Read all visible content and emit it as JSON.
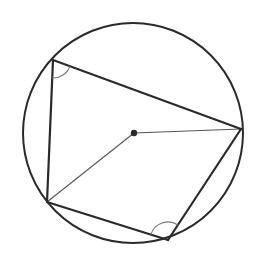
{
  "diagram": {
    "type": "cyclic-quadrilateral",
    "width": 266,
    "height": 258,
    "colors": {
      "background": "#ffffff",
      "stroke": "#2a2a2a",
      "thin_stroke": "#555555",
      "arc_stroke": "#777777"
    },
    "circle": {
      "cx": 133,
      "cy": 133,
      "r": 110
    },
    "center_point": {
      "x": 134,
      "y": 133,
      "r": 3.2
    },
    "vertices": [
      {
        "id": "A",
        "x": 53,
        "y": 60
      },
      {
        "id": "B",
        "x": 241,
        "y": 129
      },
      {
        "id": "C",
        "x": 168,
        "y": 240
      },
      {
        "id": "D",
        "x": 47,
        "y": 202
      }
    ],
    "quadrilateral_edges": [
      [
        "A",
        "B"
      ],
      [
        "B",
        "C"
      ],
      [
        "C",
        "D"
      ],
      [
        "D",
        "A"
      ]
    ],
    "radii": [
      {
        "from": "center",
        "to": "B"
      },
      {
        "from": "center",
        "to": "D"
      }
    ],
    "angle_marks": [
      {
        "vertex": "A",
        "radius": 18
      },
      {
        "vertex": "C",
        "radius": 18
      }
    ]
  }
}
